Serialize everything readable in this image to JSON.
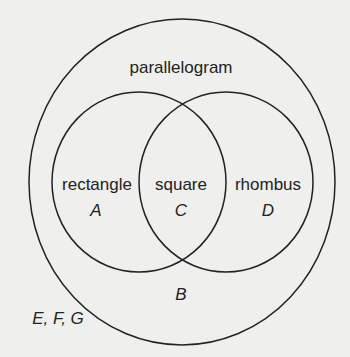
{
  "diagram": {
    "type": "venn",
    "outer_set": {
      "label": "parallelogram",
      "outside_elements": "E, F, G",
      "region_outside_inner": "B"
    },
    "inner_sets": [
      {
        "label": "rectangle",
        "region": "A"
      },
      {
        "label": "rhombus",
        "region": "D"
      }
    ],
    "intersection": {
      "label": "square",
      "region": "C"
    },
    "colors": {
      "stroke": "#222222",
      "background": "#efefed"
    }
  }
}
